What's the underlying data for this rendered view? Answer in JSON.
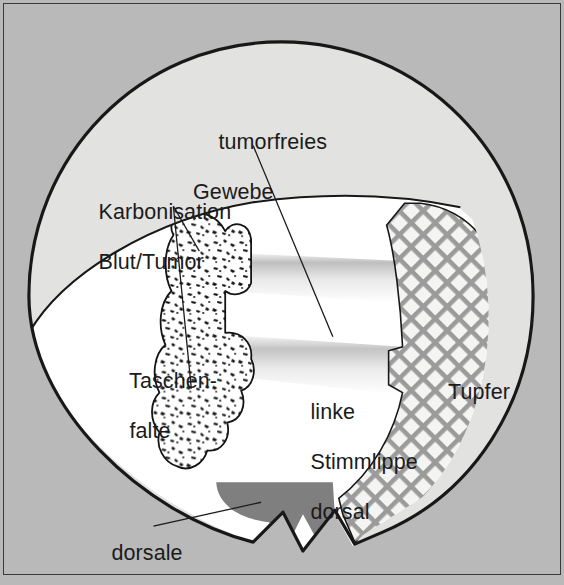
{
  "figure": {
    "kind": "anatomical-illustration",
    "background_color": "#b9b9b9",
    "frame_color": "#3a3a3a",
    "ink_color": "#1b1b1b"
  },
  "labels": {
    "tumorfreies_gewebe": {
      "line1": "tumorfreies",
      "line2": "Gewebe"
    },
    "karbonisation": {
      "line1": "Karbonisation",
      "line2": "Blut/Tumor"
    },
    "taschenfalte": {
      "line1": "Taschen-",
      "line2": "falte"
    },
    "linke_stimmlippe": {
      "line1": "linke",
      "line2": "Stimmlippe",
      "line3": "dorsal"
    },
    "tupfer": {
      "line1": "Tupfer"
    },
    "dorsale_inzision": {
      "line1": "dorsale",
      "line2": "Inzision"
    }
  },
  "regions": {
    "outer_circle": {
      "name": "Endoskopisches Gesichtsfeld",
      "fill": "#e2e2e0",
      "stroke": "#181818"
    },
    "tumorfreies_gewebe_region": {
      "name": "tumorfreies Gewebe",
      "fill": "#e2e2e0"
    },
    "taschenfalte_region": {
      "name": "Taschenfalte",
      "fill": "#ffffff"
    },
    "karbonisation_region": {
      "name": "Karbonisation Blut/Tumor",
      "fill": "#ffffff",
      "texture": "stipple"
    },
    "tupfer_region": {
      "name": "Tupfer",
      "fill": "#f2f2f0",
      "texture": "cross-hatch",
      "hatch_color": "#9a9a9a"
    },
    "dorsale_inzision_region": {
      "name": "dorsale Inzision",
      "fill": "#7f7f7f"
    },
    "stimmlippe_bands": {
      "name": "linke Stimmlippe dorsal",
      "count": 2,
      "shading": "gradient-gray-to-white"
    }
  }
}
